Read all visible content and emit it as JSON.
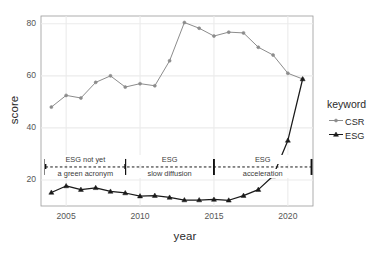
{
  "chart_data": {
    "type": "line",
    "title": "",
    "xlabel": "year",
    "ylabel": "score",
    "xlim": [
      2003.3,
      2021.7
    ],
    "ylim": [
      10.0,
      83.0
    ],
    "xticks": [
      2005,
      2010,
      2015,
      2020
    ],
    "yticks": [
      20,
      40,
      60,
      80
    ],
    "grid": true,
    "legend": {
      "title": "keyword",
      "position": "right",
      "entries": [
        {
          "name": "CSR",
          "color": "#8c8c8c",
          "marker": "circle"
        },
        {
          "name": "ESG",
          "color": "#1a1a1a",
          "marker": "triangle"
        }
      ]
    },
    "x": [
      2004,
      2005,
      2006,
      2007,
      2008,
      2009,
      2010,
      2011,
      2012,
      2013,
      2014,
      2015,
      2016,
      2017,
      2018,
      2019,
      2020,
      2021
    ],
    "series": [
      {
        "name": "CSR",
        "color": "#8c8c8c",
        "marker": "circle",
        "values": [
          48.0,
          52.5,
          51.5,
          57.5,
          60.0,
          55.7,
          57.0,
          56.2,
          65.8,
          80.5,
          78.3,
          75.3,
          76.8,
          76.5,
          71.0,
          68.0,
          61.0,
          58.8
        ]
      },
      {
        "name": "ESG",
        "color": "#1a1a1a",
        "marker": "triangle",
        "values": [
          15.2,
          17.7,
          16.3,
          17.0,
          15.6,
          15.0,
          13.8,
          14.0,
          13.3,
          12.3,
          12.3,
          12.5,
          12.2,
          14.0,
          16.3,
          21.5,
          35.2,
          58.8
        ]
      }
    ],
    "annotations": {
      "divider_score": 25.0,
      "bracket_years": [
        2003.6,
        2009.0,
        2015.0,
        2021.6
      ],
      "phases": [
        {
          "line1": "ESG not yet",
          "line2": "a green acronym",
          "center_year": 2006.3
        },
        {
          "line1": "ESG",
          "line2": "slow diffusion",
          "center_year": 2012.0
        },
        {
          "line1": "ESG",
          "line2": "acceleration",
          "center_year": 2018.3
        }
      ]
    }
  }
}
